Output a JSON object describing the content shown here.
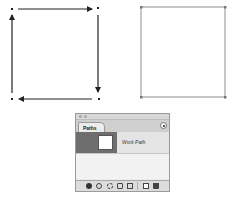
{
  "canvas": {
    "left_figure": {
      "description": "path with directional arrows",
      "anchors": [
        [
          12,
          9
        ],
        [
          98,
          8
        ],
        [
          99,
          99
        ],
        [
          12,
          99
        ]
      ],
      "stroke_color": "#222222"
    },
    "right_figure": {
      "description": "stroked rectangle path",
      "anchors": [
        [
          141,
          7
        ],
        [
          225,
          7
        ],
        [
          225,
          97
        ],
        [
          141,
          97
        ]
      ],
      "stroke_color": "#9a9a9a",
      "anchor_color": "#7a7a7a"
    }
  },
  "paths_panel": {
    "tab_label": "Paths",
    "menu_icon": "panel-menu-icon",
    "rows": [
      {
        "name": "Work Path",
        "selected": true
      }
    ],
    "toolbar": [
      {
        "icon": "fill-path-icon"
      },
      {
        "icon": "stroke-path-icon"
      },
      {
        "icon": "load-selection-icon"
      },
      {
        "icon": "make-work-path-icon"
      },
      {
        "icon": "add-mask-icon"
      },
      {
        "icon": "new-path-icon"
      },
      {
        "icon": "delete-path-icon"
      }
    ]
  },
  "colors": {
    "panel_bg": "#ececec",
    "row_selected": "#6e6e6e",
    "tabbar": "#cfcfcf"
  }
}
